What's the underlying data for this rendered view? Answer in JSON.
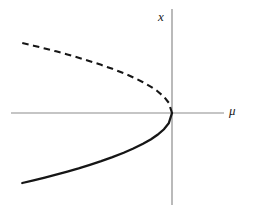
{
  "figure": {
    "name": "saddle-node-bifurcation-diagram",
    "background_color": "#ffffff"
  },
  "labels": {
    "y_axis": "x",
    "x_axis": "μ"
  },
  "chart_data": {
    "type": "line",
    "title": "",
    "subtitle": "",
    "xlabel": "μ",
    "ylabel": "x",
    "xlim": [
      -1.0,
      0.25
    ],
    "ylim": [
      -1.0,
      1.0
    ],
    "grid": false,
    "legend": null,
    "axes": {
      "x_axis_color": "#8c8c8c",
      "y_axis_color": "#8c8c8c",
      "x_axis_range_px": [
        11,
        224
      ],
      "y_axis_range_px": [
        9,
        205
      ],
      "origin_px": [
        172,
        113
      ]
    },
    "series": [
      {
        "name": "unstable-branch",
        "style": "dashed",
        "color": "#161616",
        "x": [
          -0.93,
          -0.86,
          -0.79,
          -0.72,
          -0.65,
          -0.58,
          -0.51,
          -0.44,
          -0.37,
          -0.3,
          -0.24,
          -0.18,
          -0.13,
          -0.09,
          -0.05,
          -0.02,
          0.0
        ],
        "y": [
          0.964,
          0.927,
          0.889,
          0.849,
          0.806,
          0.762,
          0.714,
          0.663,
          0.608,
          0.548,
          0.49,
          0.424,
          0.361,
          0.3,
          0.224,
          0.141,
          0.0
        ]
      },
      {
        "name": "stable-branch",
        "style": "solid",
        "color": "#161616",
        "x": [
          -0.93,
          -0.86,
          -0.79,
          -0.72,
          -0.65,
          -0.58,
          -0.51,
          -0.44,
          -0.37,
          -0.3,
          -0.24,
          -0.18,
          -0.13,
          -0.09,
          -0.05,
          -0.02,
          0.0
        ],
        "y": [
          -0.964,
          -0.927,
          -0.889,
          -0.849,
          -0.806,
          -0.762,
          -0.714,
          -0.663,
          -0.608,
          -0.548,
          -0.49,
          -0.424,
          -0.361,
          -0.3,
          -0.224,
          -0.141,
          0.0
        ]
      }
    ]
  }
}
